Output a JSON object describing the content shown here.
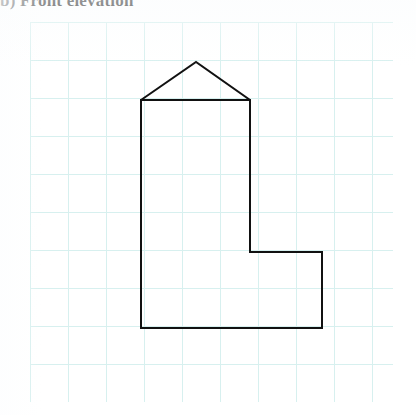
{
  "title": {
    "label": "b) Front elevation"
  },
  "grid": {
    "line_color": "#d7f0ef",
    "line_color_strong": "#c4e9e8",
    "cell_size": 38,
    "origin_x": 30,
    "origin_y": 22,
    "width": 363,
    "height": 380,
    "cols": 10,
    "rows": 10,
    "background": "#ffffff"
  },
  "figure": {
    "name": "front-elevation-outline",
    "stroke_color": "#111111",
    "stroke_width": 2,
    "fill": "none",
    "points_px": [
      [
        111,
        78
      ],
      [
        166,
        40
      ],
      [
        220,
        78
      ],
      [
        220,
        230
      ],
      [
        292,
        230
      ],
      [
        292,
        306
      ],
      [
        111,
        306
      ]
    ],
    "closed": true,
    "vertices": [
      {
        "name": "eaves-left",
        "x": 111,
        "y": 78
      },
      {
        "name": "roof-apex",
        "x": 166,
        "y": 40
      },
      {
        "name": "eaves-right",
        "x": 220,
        "y": 78
      },
      {
        "name": "tower-step-top",
        "x": 220,
        "y": 230
      },
      {
        "name": "wing-top-right",
        "x": 292,
        "y": 230
      },
      {
        "name": "base-right",
        "x": 292,
        "y": 306
      },
      {
        "name": "base-left",
        "x": 111,
        "y": 306
      }
    ],
    "eaves_line": {
      "x1": 111,
      "y1": 78,
      "x2": 220,
      "y2": 78
    }
  },
  "chart_data": {
    "type": "scatter",
    "title": "b) Front elevation",
    "xlabel": "",
    "ylabel": "",
    "grid": true,
    "legend": null,
    "x": [
      111,
      166,
      220,
      220,
      292,
      292,
      111
    ],
    "y": [
      78,
      40,
      78,
      230,
      230,
      306,
      306
    ],
    "annotations": [
      "L-shaped building outline drawn on 38 px square graph paper",
      "Pitched roof apex above the centre of the tall left tower",
      "Low right wing steps down two grid squares from the tower"
    ],
    "xlim": [
      0,
      363
    ],
    "ylim": [
      0,
      380
    ]
  }
}
